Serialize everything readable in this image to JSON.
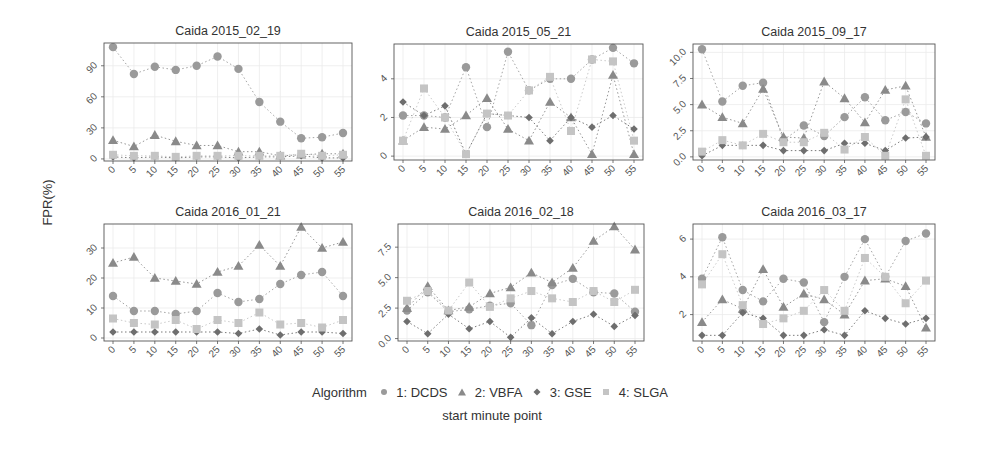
{
  "chart_data": {
    "type": "line",
    "title": "",
    "xlabel": "start minute point",
    "ylabel": "FPR(%)",
    "legend": {
      "title": "Algorithm",
      "position": "bottom",
      "entries": [
        "1: DCDS",
        "2: VBFA",
        "3: GSE",
        "4: SLGA"
      ]
    },
    "x": [
      0,
      5,
      10,
      15,
      20,
      25,
      30,
      35,
      40,
      45,
      50,
      55
    ],
    "x_tick_labels": [
      "0",
      "5",
      "10",
      "15",
      "20",
      "25",
      "30",
      "35",
      "40",
      "45",
      "50",
      "55"
    ],
    "grid": true,
    "series_style": [
      {
        "name": "1: DCDS",
        "marker": "circle",
        "color": "#9a9a9a"
      },
      {
        "name": "2: VBFA",
        "marker": "triangle",
        "color": "#8a8a8a"
      },
      {
        "name": "3: GSE",
        "marker": "diamond",
        "color": "#6e6e6e"
      },
      {
        "name": "4: SLGA",
        "marker": "square",
        "color": "#c4c4c4"
      }
    ],
    "panels": [
      {
        "title": "Caida 2015_02_19",
        "ylim": [
          -2,
          112
        ],
        "yticks": [
          0,
          30,
          60,
          90
        ],
        "ytick_labels": [
          "0",
          "30",
          "60",
          "90"
        ],
        "series": [
          {
            "name": "1: DCDS",
            "values": [
              108,
              82,
              89,
              86,
              90,
              99,
              87,
              55,
              36,
              20,
              21,
              25
            ]
          },
          {
            "name": "2: VBFA",
            "values": [
              18,
              12,
              23,
              17,
              13,
              13,
              7,
              7,
              3,
              4,
              5,
              5
            ]
          },
          {
            "name": "3: GSE",
            "values": [
              2,
              1,
              2,
              1,
              2,
              2,
              1,
              2,
              2,
              3,
              1,
              1
            ]
          },
          {
            "name": "4: SLGA",
            "values": [
              4,
              3,
              3,
              2,
              3,
              3,
              3,
              3,
              3,
              5,
              3,
              4
            ]
          }
        ]
      },
      {
        "title": "Caida 2015_05_21",
        "ylim": [
          -0.2,
          5.8
        ],
        "yticks": [
          0,
          2,
          4
        ],
        "ytick_labels": [
          "0",
          "2",
          "4"
        ],
        "series": [
          {
            "name": "1: DCDS",
            "values": [
              2.1,
              2.1,
              2.0,
              4.6,
              1.5,
              5.4,
              3.4,
              4.0,
              4.0,
              5.0,
              5.6,
              4.8
            ]
          },
          {
            "name": "2: VBFA",
            "values": [
              0.8,
              1.5,
              1.4,
              2.1,
              3.0,
              1.4,
              0.8,
              2.8,
              2.0,
              0.1,
              4.2,
              0.1
            ]
          },
          {
            "name": "3: GSE",
            "values": [
              2.8,
              2.1,
              2.6,
              0.1,
              2.2,
              2.1,
              2.0,
              0.8,
              2.0,
              1.5,
              2.1,
              1.4
            ]
          },
          {
            "name": "4: SLGA",
            "values": [
              0.8,
              3.5,
              2.0,
              0.1,
              2.2,
              2.1,
              3.4,
              4.1,
              1.3,
              5.0,
              4.9,
              0.8
            ]
          }
        ]
      },
      {
        "title": "Caida 2015_09_17",
        "ylim": [
          -0.3,
          10.8
        ],
        "yticks": [
          0,
          2.5,
          5,
          7.5,
          10
        ],
        "ytick_labels": [
          "0.0",
          "2.5",
          "5.0",
          "7.5",
          "10.0"
        ],
        "series": [
          {
            "name": "1: DCDS",
            "values": [
              10.3,
              5.3,
              6.8,
              7.1,
              1.6,
              3.0,
              2.0,
              3.8,
              5.7,
              3.5,
              4.3,
              3.2
            ]
          },
          {
            "name": "2: VBFA",
            "values": [
              5.0,
              3.8,
              3.2,
              6.5,
              1.9,
              1.8,
              7.2,
              5.6,
              3.3,
              6.4,
              6.8,
              1.9
            ]
          },
          {
            "name": "3: GSE",
            "values": [
              0.1,
              1.1,
              1.1,
              1.1,
              0.6,
              0.6,
              0.6,
              1.3,
              1.3,
              0.6,
              1.8,
              1.9
            ]
          },
          {
            "name": "4: SLGA",
            "values": [
              0.5,
              1.6,
              1.1,
              2.2,
              1.4,
              1.4,
              2.3,
              0.7,
              1.9,
              0.1,
              5.5,
              0.1
            ]
          }
        ]
      },
      {
        "title": "Caida 2016_01_21",
        "ylim": [
          -1,
          38
        ],
        "yticks": [
          0,
          10,
          20,
          30
        ],
        "ytick_labels": [
          "0",
          "10",
          "20",
          "30"
        ],
        "series": [
          {
            "name": "1: DCDS",
            "values": [
              14,
              9,
              9,
              8,
              9,
              15,
              12,
              13,
              18,
              21,
              22,
              14
            ]
          },
          {
            "name": "2: VBFA",
            "values": [
              25,
              27,
              20,
              19,
              18,
              22,
              24,
              31,
              24,
              37,
              30,
              32
            ]
          },
          {
            "name": "3: GSE",
            "values": [
              2,
              2,
              2,
              2,
              2,
              2,
              1.5,
              3,
              1,
              2,
              2,
              1.5
            ]
          },
          {
            "name": "4: SLGA",
            "values": [
              6.5,
              5,
              4.5,
              6,
              3,
              6,
              5,
              8.5,
              4.5,
              5,
              3.5,
              6
            ]
          }
        ]
      },
      {
        "title": "Caida 2016_02_18",
        "ylim": [
          -0.2,
          9.4
        ],
        "yticks": [
          0,
          2.5,
          5,
          7.5
        ],
        "ytick_labels": [
          "0.0",
          "2.5",
          "5.0",
          "7.5"
        ],
        "series": [
          {
            "name": "1: DCDS",
            "values": [
              2.3,
              3.8,
              2.2,
              2.4,
              2.7,
              2.9,
              1.1,
              4.4,
              4.9,
              3.8,
              3.7,
              2.2
            ]
          },
          {
            "name": "2: VBFA",
            "values": [
              2.5,
              4.3,
              2.3,
              2.6,
              3.7,
              4.2,
              5.4,
              4.6,
              5.8,
              8.0,
              9.2,
              7.3
            ]
          },
          {
            "name": "3: GSE",
            "values": [
              1.4,
              0.4,
              2.0,
              0.8,
              1.4,
              0.1,
              1.7,
              0.4,
              1.4,
              2.0,
              1.0,
              1.9
            ]
          },
          {
            "name": "4: SLGA",
            "values": [
              3.1,
              3.9,
              2.3,
              4.6,
              2.6,
              3.3,
              3.9,
              3.3,
              3.0,
              3.9,
              3.0,
              4.0
            ]
          }
        ]
      },
      {
        "title": "Caida 2016_03_17",
        "ylim": [
          0.6,
          6.8
        ],
        "yticks": [
          2,
          4,
          6
        ],
        "ytick_labels": [
          "2",
          "4",
          "6"
        ],
        "series": [
          {
            "name": "1: DCDS",
            "values": [
              3.9,
              6.1,
              3.3,
              2.7,
              3.9,
              3.7,
              1.6,
              4.0,
              6.0,
              4.0,
              5.9,
              6.3
            ]
          },
          {
            "name": "2: VBFA",
            "values": [
              1.6,
              2.8,
              2.3,
              4.4,
              2.4,
              3.1,
              2.8,
              2.0,
              3.8,
              3.9,
              3.5,
              1.3
            ]
          },
          {
            "name": "3: GSE",
            "values": [
              0.9,
              0.9,
              2.1,
              1.8,
              0.9,
              0.9,
              1.2,
              0.9,
              2.2,
              1.8,
              1.5,
              1.8
            ]
          },
          {
            "name": "4: SLGA",
            "values": [
              3.6,
              5.2,
              2.5,
              1.5,
              1.8,
              2.2,
              3.3,
              2.2,
              5.0,
              4.0,
              2.6,
              3.8
            ]
          }
        ]
      }
    ]
  },
  "figure": {
    "ylabel": "FPR(%)",
    "xlabel": "start minute point",
    "legend_title": "Algorithm",
    "legend_items": [
      {
        "label": "1: DCDS",
        "marker": "circle"
      },
      {
        "label": "2: VBFA",
        "marker": "triangle"
      },
      {
        "label": "3: GSE",
        "marker": "diamond"
      },
      {
        "label": "4: SLGA",
        "marker": "square"
      }
    ]
  }
}
